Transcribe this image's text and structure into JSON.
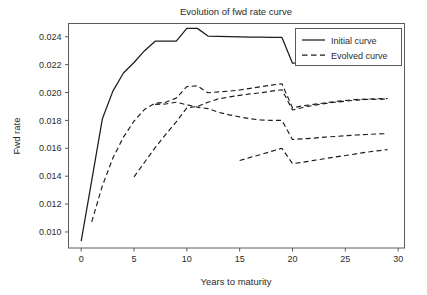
{
  "chart_data": {
    "type": "line",
    "title": "Evolution of fwd rate curve",
    "xlabel": "Years to maturity",
    "ylabel": "Fwd rate",
    "xlim": [
      -1.2,
      30.6
    ],
    "ylim": [
      0.00885,
      0.02495
    ],
    "xticks": [
      0,
      5,
      10,
      15,
      20,
      25,
      30
    ],
    "xtick_labels": [
      "0",
      "5",
      "10",
      "15",
      "20",
      "25",
      "30"
    ],
    "yticks": [
      0.01,
      0.012,
      0.014,
      0.016,
      0.018,
      0.02,
      0.022,
      0.024
    ],
    "ytick_labels": [
      "0.010",
      "0.012",
      "0.014",
      "0.016",
      "0.018",
      "0.020",
      "0.022",
      "0.024"
    ],
    "grid": false,
    "legend_position": "upper right",
    "legend": [
      {
        "label": "Initial curve",
        "style": "solid"
      },
      {
        "label": "Evolved curve",
        "style": "dashed"
      }
    ],
    "series": [
      {
        "name": "Initial curve",
        "style": "solid",
        "x": [
          0,
          1,
          2,
          3,
          4,
          5,
          6,
          7,
          8,
          9,
          10,
          11,
          12,
          13,
          14,
          15,
          16,
          17,
          18,
          19,
          20,
          21,
          22,
          23,
          24,
          25,
          26,
          27,
          28,
          29
        ],
        "y": [
          0.00935,
          0.0137,
          0.0181,
          0.0201,
          0.0214,
          0.02215,
          0.023,
          0.02368,
          0.02368,
          0.02368,
          0.0246,
          0.0246,
          0.02405,
          0.02403,
          0.02401,
          0.02399,
          0.02398,
          0.02397,
          0.02396,
          0.02395,
          0.0221,
          0.0221,
          0.0221,
          0.0221,
          0.0221,
          0.0221,
          0.0221,
          0.0221,
          0.0221,
          0.0221
        ]
      },
      {
        "name": "Evolved curve 1",
        "style": "dashed",
        "x": [
          1,
          2,
          3,
          4,
          5,
          6,
          7,
          8,
          9,
          10,
          11,
          12,
          13,
          14,
          15,
          16,
          17,
          18,
          19,
          20,
          21,
          22,
          23,
          24,
          25,
          26,
          27,
          28,
          29
        ],
        "y": [
          0.01073,
          0.0133,
          0.0153,
          0.0168,
          0.01795,
          0.0188,
          0.01923,
          0.0193,
          0.0196,
          0.02043,
          0.02048,
          0.01998,
          0.02005,
          0.0201,
          0.02018,
          0.0203,
          0.02042,
          0.02053,
          0.02063,
          0.0189,
          0.01905,
          0.01915,
          0.01925,
          0.01935,
          0.01943,
          0.0195,
          0.01953,
          0.01955,
          0.01957
        ]
      },
      {
        "name": "Evolved curve 2",
        "style": "dashed",
        "x": [
          5,
          6,
          7,
          8,
          9,
          10,
          11,
          12,
          13,
          14,
          15,
          16,
          17,
          18,
          19,
          20,
          21,
          22,
          23,
          24,
          25,
          26,
          27,
          28,
          29
        ],
        "y": [
          0.01395,
          0.015,
          0.01605,
          0.017,
          0.0179,
          0.0189,
          0.019,
          0.0193,
          0.01955,
          0.01968,
          0.0198,
          0.0199,
          0.01998,
          0.0201,
          0.0202,
          0.01875,
          0.01893,
          0.01908,
          0.0192,
          0.0193,
          0.01938,
          0.01945,
          0.0195,
          0.01952,
          0.01953
        ]
      },
      {
        "name": "Evolved curve 3",
        "style": "dashed",
        "x": [
          7,
          8,
          9,
          10,
          11,
          12,
          13,
          14,
          15,
          16,
          17,
          18,
          19,
          20,
          21,
          22,
          23,
          24,
          25,
          26,
          27,
          28,
          29
        ],
        "y": [
          0.01915,
          0.01918,
          0.0193,
          0.01912,
          0.01895,
          0.01885,
          0.01858,
          0.0184,
          0.01825,
          0.01812,
          0.01803,
          0.018,
          0.018,
          0.01663,
          0.01668,
          0.01673,
          0.0168,
          0.01685,
          0.0169,
          0.01695,
          0.01699,
          0.01703,
          0.01705
        ]
      },
      {
        "name": "Evolved curve 4",
        "style": "dashed",
        "x": [
          15,
          16,
          17,
          18,
          19,
          20,
          21,
          22,
          23,
          24,
          25,
          26,
          27,
          28,
          29
        ],
        "y": [
          0.01512,
          0.01535,
          0.01555,
          0.01578,
          0.016,
          0.0149,
          0.015,
          0.01513,
          0.01525,
          0.01537,
          0.01548,
          0.0156,
          0.01572,
          0.01582,
          0.0159
        ]
      }
    ]
  },
  "axes": {
    "title": "Evolution of fwd rate curve",
    "x_axis_title": "Years to maturity",
    "y_axis_title": "Fwd rate"
  }
}
